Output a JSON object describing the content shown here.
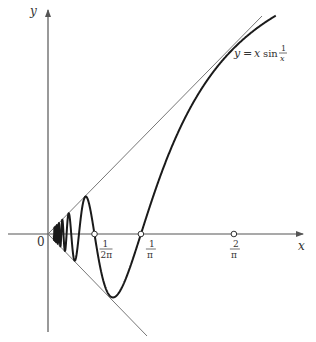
{
  "diagram": {
    "function_label": {
      "lhs": "y",
      "eq": "=",
      "x": "x",
      "sin": "sin",
      "num": "1",
      "den": "x"
    },
    "axes": {
      "x_label": "x",
      "y_label": "y",
      "origin_label": "0"
    },
    "tick_marks": [
      {
        "num": "1",
        "den": "2π",
        "value": 0.159155
      },
      {
        "num": "1",
        "den": "π",
        "value": 0.31831
      },
      {
        "num": "2",
        "den": "π",
        "value": 0.63662
      }
    ],
    "colors": {
      "curve": "#1a1a1a",
      "axes": "#555555",
      "envelope": "#777777",
      "text": "#333333"
    }
  },
  "chart_data": {
    "type": "line",
    "xlabel": "x",
    "ylabel": "y",
    "series": [
      {
        "name": "y = x sin(1/x)",
        "function": "x*sin(1/x)",
        "x_range": [
          0.02,
          0.78
        ]
      },
      {
        "name": "y = x",
        "function": "x",
        "x_range": [
          0,
          0.73
        ]
      },
      {
        "name": "y = -x",
        "function": "-x",
        "x_range": [
          0,
          0.34
        ]
      }
    ],
    "annotations": [
      {
        "x": 0.159155,
        "label": "1/2π",
        "type": "zero-crossing"
      },
      {
        "x": 0.31831,
        "label": "1/π",
        "type": "zero-crossing"
      },
      {
        "x": 0.63662,
        "label": "2/π",
        "type": "tangent-point"
      }
    ],
    "grid": false,
    "legend": "none"
  }
}
